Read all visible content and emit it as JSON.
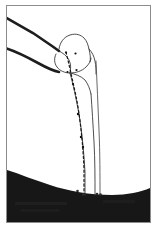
{
  "figure": {
    "kind": "radiographic-tracing",
    "frame": {
      "border_color": "#8d8d8d",
      "background_color": "#ffffff",
      "x": 6,
      "y": 5,
      "width": 145,
      "height": 218
    },
    "ink_color": "#1a1a1a",
    "thin_line_color": "#4a4a4a",
    "shadow_fill_color": "#171717",
    "elements": [
      {
        "name": "upper-thick-guideline",
        "label": "Upper thick guide line",
        "stroke": "#1d1d1d",
        "width": 2.6
      },
      {
        "name": "lower-thick-guideline",
        "label": "Lower thick guide curve",
        "stroke": "#1d1d1d",
        "width": 2.6
      },
      {
        "name": "bone-head-outline",
        "label": "Bone head / epiphysis outline",
        "stroke": "#3a3a3a",
        "width": 0.9
      },
      {
        "name": "bone-neck-outline",
        "label": "Bone neck outline",
        "stroke": "#3a3a3a",
        "width": 0.9
      },
      {
        "name": "bone-shaft-medial-cortex",
        "label": "Medial cortical border",
        "stroke": "#3a3a3a",
        "width": 0.9
      },
      {
        "name": "bone-shaft-lateral-cortex",
        "label": "Lateral cortical border",
        "stroke": "#3a3a3a",
        "width": 0.9
      },
      {
        "name": "bone-shaft-outer-cortex",
        "label": "Outer cortical border",
        "stroke": "#3a3a3a",
        "width": 0.9
      },
      {
        "name": "dotted-measurement-axis",
        "label": "Dotted measurement axis",
        "stroke": "#1a1a1a",
        "width": 1.1
      },
      {
        "name": "soft-tissue-shadow",
        "label": "Soft-tissue shadow region",
        "fill": "#171717"
      }
    ],
    "landmark_points": [
      {
        "name": "landmark-point-1",
        "x": 61.0,
        "y": 48.5
      },
      {
        "name": "landmark-point-2",
        "x": 70.5,
        "y": 49.5
      },
      {
        "name": "landmark-point-3",
        "x": 62.5,
        "y": 68.0
      },
      {
        "name": "landmark-point-4",
        "x": 71.5,
        "y": 66.0
      },
      {
        "name": "landmark-point-5",
        "x": 68.0,
        "y": 80.0
      },
      {
        "name": "landmark-point-6",
        "x": 81.0,
        "y": 110.0
      },
      {
        "name": "landmark-point-7",
        "x": 83.5,
        "y": 133.0
      },
      {
        "name": "landmark-point-8",
        "x": 85.0,
        "y": 143.0
      },
      {
        "name": "landmark-point-9",
        "x": 72.5,
        "y": 187.0
      },
      {
        "name": "landmark-point-10",
        "x": 78.5,
        "y": 190.5
      },
      {
        "name": "landmark-point-11",
        "x": 92.0,
        "y": 190.0
      },
      {
        "name": "landmark-point-12",
        "x": 95.5,
        "y": 190.5
      }
    ],
    "paths": {
      "upper_thick_guideline": "M 0 13 L 28 29 L 47 42 L 54 47",
      "lower_thick_guideline": "M 0 44 C 10 47 22 53 33 59 C 42 64 49 67 54 68",
      "soft_tissue_shadow": "M 0 166 C 14 170 28 176 44 181 C 62 187 84 191 106 191 C 122 191 136 188 145 184 L 145 218 L 0 218 Z",
      "bone_head": "M 54 45 C 55 38 59 33 65 31 C 71 29 76 31 79 34 C 82 37 83 41 84 45 C 85 50 86 54 85 58",
      "bone_head_right": "M 84 45 C 87 48 89 52 90 57 C 91 62 91 66 91 70",
      "bone_neck_left": "M 51 50 C 49 54 49 59 52 63 C 55 67 60 69 65 69",
      "bone_neck_inner": "M 54 47 C 58 49 62 52 64 56 C 66 60 66 64 65 69",
      "bone_head_lower": "M 65 69 C 71 69 77 67 81 63 C 84 60 86 57 86 54",
      "bone_neck_connector": "M 65 69 C 70 70 76 72 80 76 C 83 80 85 85 86 90",
      "shaft_medial": "M 65 69 C 68 80 71 94 74 110 C 77 128 79 150 80 168 C 80 177 80 184 80 190",
      "shaft_lateral": "M 86 90 C 87 104 88 120 89 138 C 90 156 90 174 90 190",
      "shaft_outer": "M 91 57 C 92 78 93 102 94 126 C 95 150 95 172 95 190",
      "dotted_axis": "M 61 48 C 64 60 67 74 71 92 C 75 112 78 140 79 165 C 79 176 79 184 79 190"
    }
  }
}
